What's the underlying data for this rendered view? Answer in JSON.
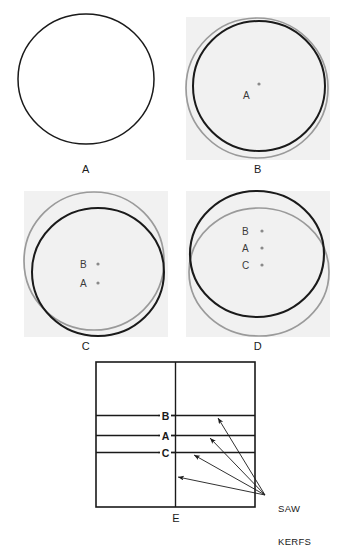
{
  "figure": {
    "background": "#ffffff",
    "ink_color": "#1a1a1a",
    "gray_circle_color": "#9a9a9a",
    "panel_fill": "#f1f1f1",
    "dot_color": "#8a8a8a"
  },
  "panels": [
    {
      "id": "panel-a",
      "label": "A",
      "has_gray_background": false,
      "circles": [
        {
          "name": "black-circle",
          "color": "#1a1a1a",
          "stroke": 1.4
        }
      ],
      "dots": []
    },
    {
      "id": "panel-b",
      "label": "B",
      "has_gray_background": true,
      "circles": [
        {
          "name": "gray-circle",
          "color": "#9a9a9a",
          "stroke": 1.6
        },
        {
          "name": "black-circle",
          "color": "#1a1a1a",
          "stroke": 2.0
        }
      ],
      "dots": [
        {
          "label": "A"
        }
      ]
    },
    {
      "id": "panel-c",
      "label": "C",
      "has_gray_background": true,
      "circles": [
        {
          "name": "gray-circle",
          "color": "#9a9a9a",
          "stroke": 1.6
        },
        {
          "name": "black-circle",
          "color": "#1a1a1a",
          "stroke": 2.0
        }
      ],
      "dots": [
        {
          "label": "B"
        },
        {
          "label": "A"
        }
      ]
    },
    {
      "id": "panel-d",
      "label": "D",
      "has_gray_background": true,
      "circles": [
        {
          "name": "gray-circle",
          "color": "#9a9a9a",
          "stroke": 1.6
        },
        {
          "name": "black-circle",
          "color": "#1a1a1a",
          "stroke": 2.0
        }
      ],
      "dots": [
        {
          "label": "B"
        },
        {
          "label": "A"
        },
        {
          "label": "C"
        }
      ]
    },
    {
      "id": "panel-e",
      "label": "E",
      "has_gray_background": false,
      "kerf_lines": [
        {
          "label": "B"
        },
        {
          "label": "A"
        },
        {
          "label": "C"
        }
      ],
      "annotation": {
        "line1": "SAW",
        "line2": "KERFS",
        "arrow_count": 4
      }
    }
  ],
  "labels": {
    "panel_a": "A",
    "panel_b": "B",
    "panel_c": "C",
    "panel_d": "D",
    "panel_e": "E",
    "dot_b_panelB": "A",
    "dot_b_panelC_top": "B",
    "dot_b_panelC_bottom": "A",
    "dot_d_1": "B",
    "dot_d_2": "A",
    "dot_d_3": "C",
    "kerf_b": "B",
    "kerf_a": "A",
    "kerf_c": "C",
    "saw": "SAW",
    "kerfs": "KERFS"
  }
}
